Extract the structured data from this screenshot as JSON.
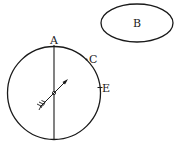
{
  "diagram": {
    "stroke_color": "#1a1a1a",
    "background": "#ffffff",
    "labels": {
      "A": "A",
      "B": "B",
      "C": "C",
      "E": "E"
    },
    "shapes": {
      "circle": {
        "cx": 54,
        "cy": 93,
        "r": 46.5
      },
      "ellipse_b": {
        "cx": 137,
        "cy": 23,
        "rx": 36,
        "ry": 19
      },
      "vertical_line": {
        "x": 54,
        "y1": 45,
        "y2": 140
      },
      "arrow": {
        "x1": 39,
        "y1": 108,
        "x2": 68,
        "y2": 79
      }
    }
  }
}
